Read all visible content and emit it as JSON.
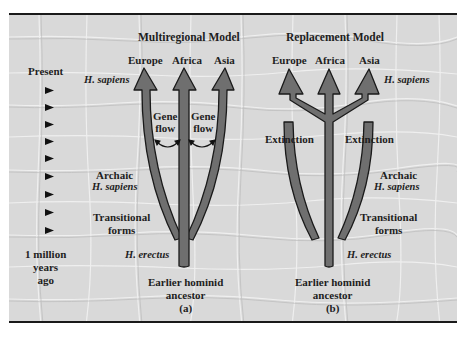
{
  "colors": {
    "background": "#d9d9d9",
    "arrow_fill": "#6f6f6f",
    "arrow_stroke": "#1a1a1a",
    "text": "#1e1e1e",
    "frame_border": "#1a1a1a"
  },
  "timeline": {
    "top_label": "Present",
    "bottom_label_lines": [
      "1 million",
      "years",
      "ago"
    ],
    "tick_count": 9,
    "tick_icon": "triangle-pointer-right"
  },
  "panel_a": {
    "title": "Multiregional Model",
    "regions": [
      "Europe",
      "Africa",
      "Asia"
    ],
    "gene_flow_labels": [
      [
        "Gene",
        "flow"
      ],
      [
        "Gene",
        "flow"
      ]
    ],
    "stage_labels": {
      "h_sapiens": "H. sapiens",
      "archaic": "Archaic",
      "archaic_species": "H. sapiens",
      "transitional": [
        "Transitional",
        "forms"
      ],
      "h_erectus": "H. erectus"
    },
    "ancestor": [
      "Earlier hominid",
      "ancestor"
    ],
    "caption": "(a)"
  },
  "panel_b": {
    "title": "Replacement Model",
    "regions": [
      "Europe",
      "Africa",
      "Asia"
    ],
    "extinction_labels": [
      "Extinction",
      "Extinction"
    ],
    "stage_labels": {
      "h_sapiens": "H. sapiens",
      "archaic": "Archaic",
      "archaic_species": "H. sapiens",
      "transitional": [
        "Transitional",
        "forms"
      ],
      "h_erectus": "H. erectus"
    },
    "ancestor": [
      "Earlier hominid",
      "ancestor"
    ],
    "caption": "(b)"
  }
}
